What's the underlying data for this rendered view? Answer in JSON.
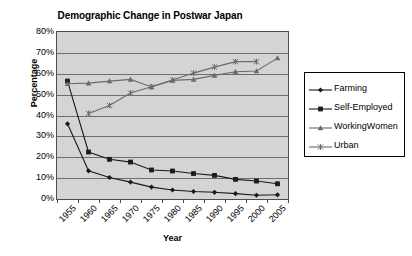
{
  "chart_data": {
    "type": "line",
    "title": "Demographic Change in Postwar Japan",
    "xlabel": "Year",
    "ylabel": "Percentage",
    "categories": [
      "1955",
      "1960",
      "1965",
      "1970",
      "1975",
      "1980",
      "1985",
      "1990",
      "1995",
      "2000",
      "2005"
    ],
    "ylim": [
      0,
      80
    ],
    "ytick_labels": [
      "0%",
      "10%",
      "20%",
      "30%",
      "40%",
      "50%",
      "60%",
      "70%",
      "80%"
    ],
    "ytick_values": [
      0,
      10,
      20,
      30,
      40,
      50,
      60,
      70,
      80
    ],
    "grid": true,
    "legend_position": "right",
    "series": [
      {
        "name": "Farming",
        "marker": "diamond",
        "color": "#1a1a1a",
        "values": [
          36,
          13.5,
          10.3,
          8.1,
          5.7,
          4.3,
          3.6,
          3.2,
          2.6,
          1.8,
          2.0
        ]
      },
      {
        "name": "Self-Employed",
        "marker": "square",
        "color": "#1a1a1a",
        "values": [
          56.5,
          22.5,
          19.0,
          17.7,
          13.9,
          13.4,
          12.2,
          11.3,
          9.4,
          8.6,
          7.3
        ]
      },
      {
        "name": "WorkingWomen",
        "marker": "triangle",
        "color": "#6b6b6b",
        "values": [
          55.2,
          55.5,
          56.5,
          57.3,
          53.7,
          56.8,
          57.3,
          59.2,
          61.0,
          61.3,
          67.5
        ]
      },
      {
        "name": "Urban",
        "marker": "x",
        "color": "#6b6b6b",
        "values": [
          null,
          41.0,
          44.8,
          50.8,
          53.8,
          57.0,
          60.3,
          63.2,
          65.8,
          65.8,
          null
        ]
      }
    ]
  },
  "legend": {
    "items": [
      {
        "label": "Farming"
      },
      {
        "label": "Self-Employed"
      },
      {
        "label": "WorkingWomen"
      },
      {
        "label": "Urban"
      }
    ]
  }
}
